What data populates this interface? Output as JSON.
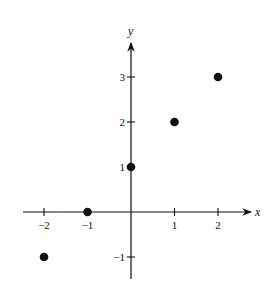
{
  "chart_data": {
    "type": "scatter",
    "title": "",
    "xlabel": "x",
    "ylabel": "y",
    "x": [
      -2,
      -1,
      0,
      1,
      2
    ],
    "y": [
      -1,
      0,
      1,
      2,
      3
    ],
    "series": [
      {
        "name": "points",
        "points": [
          [
            -2,
            -1
          ],
          [
            -1,
            0
          ],
          [
            0,
            1
          ],
          [
            1,
            2
          ],
          [
            2,
            3
          ]
        ]
      }
    ],
    "xticks": [
      -2,
      -1,
      1,
      2
    ],
    "xtick_labels": [
      "−2",
      "−1",
      "1",
      "2"
    ],
    "yticks": [
      -1,
      1,
      2,
      3
    ],
    "ytick_labels": [
      "−1",
      "1",
      "2",
      "3"
    ],
    "xlim": [
      -2.5,
      2.8
    ],
    "ylim": [
      -1.5,
      3.9
    ],
    "grid": false,
    "legend": null
  },
  "axes": {
    "x_label": "x",
    "y_label": "y"
  },
  "colors": {
    "ink": "#111111",
    "background": "#ffffff"
  }
}
